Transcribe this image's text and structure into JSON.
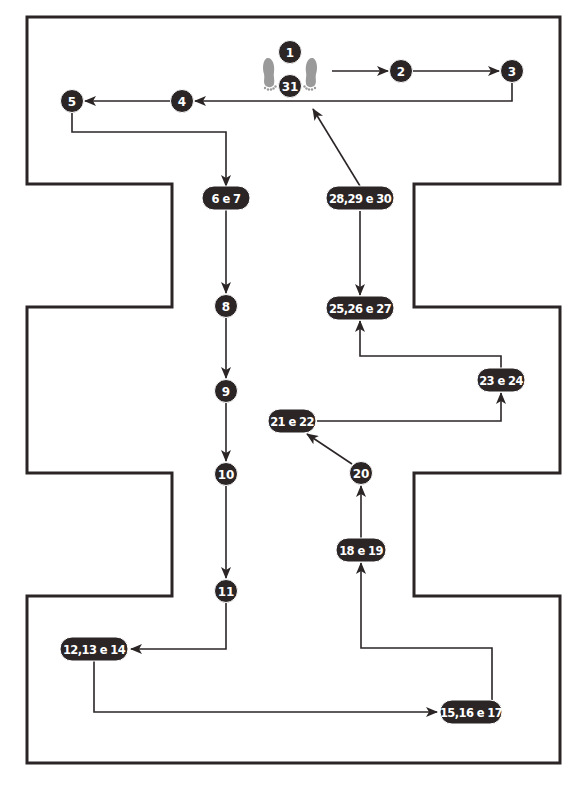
{
  "colors": {
    "ink": "#2b2526",
    "node_fill": "#2b2526",
    "node_text": "#ffffff",
    "foot": "#9a9a9a",
    "background": "#ffffff"
  },
  "outline": {
    "points": [
      [
        27,
        17
      ],
      [
        560,
        17
      ],
      [
        560,
        184
      ],
      [
        414,
        184
      ],
      [
        414,
        307
      ],
      [
        560,
        307
      ],
      [
        560,
        473
      ],
      [
        414,
        473
      ],
      [
        414,
        596
      ],
      [
        560,
        596
      ],
      [
        560,
        763
      ],
      [
        27,
        763
      ],
      [
        27,
        596
      ],
      [
        172,
        596
      ],
      [
        172,
        473
      ],
      [
        27,
        473
      ],
      [
        27,
        307
      ],
      [
        172,
        307
      ],
      [
        172,
        184
      ],
      [
        27,
        184
      ]
    ]
  },
  "start_icon": {
    "name": "footprints-icon",
    "left_foot": [
      270,
      72
    ],
    "right_foot": [
      310,
      72
    ]
  },
  "nodes": [
    {
      "id": "n1",
      "label": "1",
      "shape": "circle",
      "x": 290,
      "y": 52,
      "w": 22
    },
    {
      "id": "n31",
      "label": "31",
      "shape": "circle",
      "x": 290,
      "y": 86,
      "w": 22
    },
    {
      "id": "n2",
      "label": "2",
      "shape": "circle",
      "x": 401,
      "y": 71,
      "w": 22
    },
    {
      "id": "n3",
      "label": "3",
      "shape": "circle",
      "x": 512,
      "y": 71,
      "w": 22
    },
    {
      "id": "n4",
      "label": "4",
      "shape": "circle",
      "x": 182,
      "y": 101,
      "w": 22
    },
    {
      "id": "n5",
      "label": "5",
      "shape": "circle",
      "x": 72,
      "y": 101,
      "w": 22
    },
    {
      "id": "n6",
      "label": "6 e 7",
      "shape": "pill",
      "x": 226,
      "y": 198,
      "w": 48
    },
    {
      "id": "n8",
      "label": "8",
      "shape": "circle",
      "x": 226,
      "y": 306,
      "w": 22
    },
    {
      "id": "n9",
      "label": "9",
      "shape": "circle",
      "x": 226,
      "y": 391,
      "w": 22
    },
    {
      "id": "n10",
      "label": "10",
      "shape": "circle",
      "x": 226,
      "y": 474,
      "w": 22
    },
    {
      "id": "n11",
      "label": "11",
      "shape": "circle",
      "x": 226,
      "y": 591,
      "w": 22
    },
    {
      "id": "n12",
      "label": "12,13 e 14",
      "shape": "pill",
      "x": 94,
      "y": 649,
      "w": 68
    },
    {
      "id": "n15",
      "label": "15,16 e 17",
      "shape": "pill",
      "x": 471,
      "y": 712,
      "w": 62
    },
    {
      "id": "n18",
      "label": "18 e 19",
      "shape": "pill",
      "x": 361,
      "y": 550,
      "w": 50
    },
    {
      "id": "n20",
      "label": "20",
      "shape": "circle",
      "x": 361,
      "y": 473,
      "w": 22
    },
    {
      "id": "n21",
      "label": "21 e 22",
      "shape": "pill",
      "x": 292,
      "y": 421,
      "w": 48
    },
    {
      "id": "n23",
      "label": "23 e 24",
      "shape": "pill",
      "x": 501,
      "y": 380,
      "w": 48
    },
    {
      "id": "n25",
      "label": "25,26 e 27",
      "shape": "pill",
      "x": 360,
      "y": 308,
      "w": 68
    },
    {
      "id": "n28",
      "label": "28,29 e 30",
      "shape": "pill",
      "x": 360,
      "y": 198,
      "w": 68
    }
  ],
  "edges": [
    {
      "from": "start",
      "to": "2",
      "points": [
        [
          332,
          71
        ],
        [
          388,
          71
        ]
      ]
    },
    {
      "from": "2",
      "to": "3",
      "points": [
        [
          412,
          71
        ],
        [
          499,
          71
        ]
      ]
    },
    {
      "from": "3",
      "to": "4",
      "points": [
        [
          512,
          82
        ],
        [
          512,
          101
        ],
        [
          195,
          101
        ]
      ]
    },
    {
      "from": "4",
      "to": "5",
      "points": [
        [
          171,
          101
        ],
        [
          85,
          101
        ]
      ]
    },
    {
      "from": "5",
      "to": "6 e 7",
      "points": [
        [
          72,
          112
        ],
        [
          72,
          132
        ],
        [
          226,
          132
        ],
        [
          226,
          186
        ]
      ]
    },
    {
      "from": "6 e 7",
      "to": "8",
      "points": [
        [
          226,
          210
        ],
        [
          226,
          293
        ]
      ]
    },
    {
      "from": "8",
      "to": "9",
      "points": [
        [
          226,
          317
        ],
        [
          226,
          378
        ]
      ]
    },
    {
      "from": "9",
      "to": "10",
      "points": [
        [
          226,
          402
        ],
        [
          226,
          461
        ]
      ]
    },
    {
      "from": "10",
      "to": "11",
      "points": [
        [
          226,
          485
        ],
        [
          226,
          578
        ]
      ]
    },
    {
      "from": "11",
      "to": "12,13 e 14",
      "points": [
        [
          226,
          602
        ],
        [
          226,
          649
        ],
        [
          131,
          649
        ]
      ]
    },
    {
      "from": "12,13 e 14",
      "to": "15,16 e 17",
      "points": [
        [
          94,
          661
        ],
        [
          94,
          712
        ],
        [
          437,
          712
        ]
      ]
    },
    {
      "from": "15,16 e 17",
      "to": "18 e 19",
      "points": [
        [
          492,
          700
        ],
        [
          492,
          648
        ],
        [
          361,
          648
        ],
        [
          361,
          563
        ]
      ]
    },
    {
      "from": "18 e 19",
      "to": "20",
      "points": [
        [
          361,
          538
        ],
        [
          361,
          486
        ]
      ]
    },
    {
      "from": "20",
      "to": "21 e 22",
      "points": [
        [
          352,
          464
        ],
        [
          307,
          434
        ]
      ]
    },
    {
      "from": "21 e 22",
      "to": "23 e 24",
      "points": [
        [
          317,
          421
        ],
        [
          501,
          421
        ],
        [
          501,
          393
        ]
      ]
    },
    {
      "from": "23 e 24",
      "to": "25,26 e 27",
      "points": [
        [
          501,
          368
        ],
        [
          501,
          356
        ],
        [
          360,
          356
        ],
        [
          360,
          321
        ]
      ]
    },
    {
      "from": "28,29 e 30",
      "to": "25,26 e 27",
      "points": [
        [
          360,
          211
        ],
        [
          360,
          295
        ]
      ]
    },
    {
      "from": "28,29 e 30",
      "to": "31",
      "points": [
        [
          360,
          186
        ],
        [
          313,
          109
        ]
      ]
    }
  ]
}
